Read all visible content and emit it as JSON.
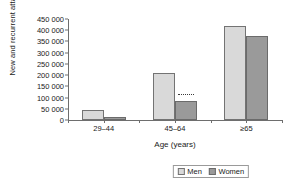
{
  "chart_data": {
    "type": "bar",
    "title": "",
    "xlabel": "Age (years)",
    "ylabel": "New and recurrent attacks",
    "categories": [
      "29–44",
      "45–64",
      "≥65"
    ],
    "series": [
      {
        "name": "Men",
        "color": "#d9d9d9",
        "values": [
          45000,
          210000,
          420000
        ]
      },
      {
        "name": "Women",
        "color": "#9a9a9a",
        "values": [
          12000,
          85000,
          375000
        ]
      }
    ],
    "ylim": [
      0,
      450000
    ],
    "ytick_values": [
      0,
      50000,
      100000,
      150000,
      200000,
      250000,
      300000,
      350000,
      400000,
      450000
    ],
    "ytick_labels": [
      "0",
      "50 000",
      "100 000",
      "150 000",
      "200 000",
      "250 000",
      "300 000",
      "350 000",
      "400 000",
      "450 000"
    ],
    "grid": false,
    "legend_position": "bottom-right",
    "annotations": [
      {
        "name": "dotted-marker",
        "category": "45–64",
        "series": "Women",
        "value": 110000
      }
    ]
  },
  "legend": {
    "items": [
      {
        "label": "Men"
      },
      {
        "label": "Women"
      }
    ]
  }
}
